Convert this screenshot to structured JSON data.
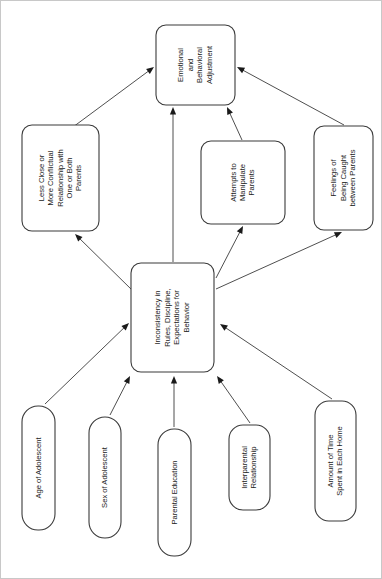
{
  "diagram": {
    "orientation": "rotated-90-counterclockwise",
    "colors": {
      "background": "#ffffff",
      "box_fill": "#ffffff",
      "box_stroke": "#3b3b3b",
      "text": "#1a1a1a",
      "edge": "#3b3b3b",
      "page_border": "#c8c8c8"
    },
    "nodes": [
      {
        "id": "emotional-behavioral-adjustment",
        "name": "Emotional and Behavioral Adjustment",
        "lines": [
          "Emotional",
          "and",
          "Behavioral",
          "Adjustment"
        ],
        "x": 155,
        "y": 24,
        "w": 79,
        "h": 80,
        "r": 10,
        "role": "outcome"
      },
      {
        "id": "less-close-more-conflictual",
        "name": "Less Close or More Conflictual Relationship with One or Both Parents",
        "lines": [
          "Less Close or",
          "More Conflictual",
          "Relationship with",
          "One or Both",
          "Parents"
        ],
        "x": 21,
        "y": 124,
        "w": 77,
        "h": 106,
        "r": 10,
        "role": "mediator"
      },
      {
        "id": "attempts-to-manipulate-parents",
        "name": "Attempts to Manipulate Parents",
        "lines": [
          "Attempts to",
          "Manipulate",
          "Parents"
        ],
        "x": 200,
        "y": 140,
        "w": 84,
        "h": 83,
        "r": 10,
        "role": "mediator"
      },
      {
        "id": "feelings-of-being-caught",
        "name": "Feelings of Being Caught between Parents",
        "lines": [
          "Feelings of",
          "Being Caught",
          "between Parents"
        ],
        "x": 313,
        "y": 125,
        "w": 59,
        "h": 104,
        "r": 10,
        "role": "mediator"
      },
      {
        "id": "inconsistency-in-rules",
        "name": "Inconsistency in Rules, Discipline, Expectations for Behavior",
        "lines": [
          "Inconsistency in",
          "Rules, Discipline,",
          "Expectations for",
          "Behavior"
        ],
        "x": 130,
        "y": 262,
        "w": 83,
        "h": 109,
        "r": 10,
        "role": "central"
      },
      {
        "id": "age-of-adolescent",
        "name": "Age of Adolescent",
        "lines": [
          "Age of Adolescent"
        ],
        "x": 21,
        "y": 405,
        "w": 33,
        "h": 124,
        "r": 16,
        "role": "predictor"
      },
      {
        "id": "sex-of-adolescent",
        "name": "Sex of Adolescent",
        "lines": [
          "Sex of Adolescent"
        ],
        "x": 88,
        "y": 416,
        "w": 32,
        "h": 121,
        "r": 16,
        "role": "predictor"
      },
      {
        "id": "parental-education",
        "name": "Parental Education",
        "lines": [
          "Parental Education"
        ],
        "x": 157,
        "y": 428,
        "w": 33,
        "h": 127,
        "r": 16,
        "role": "predictor"
      },
      {
        "id": "interparental-relationship",
        "name": "Interparental Relationship",
        "lines": [
          "Interparental",
          "Relationship"
        ],
        "x": 228,
        "y": 424,
        "w": 41,
        "h": 85,
        "r": 14,
        "role": "predictor"
      },
      {
        "id": "amount-of-time-spent-in-each-home",
        "name": "Amount of Time Spent in Each Home",
        "lines": [
          "Amount of Time",
          "Spent in Each Home"
        ],
        "x": 314,
        "y": 400,
        "w": 41,
        "h": 120,
        "r": 14,
        "role": "predictor"
      }
    ],
    "edges": [
      {
        "id": "edge-less-close-to-adjustment",
        "from": "less-close-more-conflictual",
        "to": "emotional-behavioral-adjustment",
        "x1": 72,
        "y1": 126,
        "x2": 153,
        "y2": 66
      },
      {
        "id": "edge-inconsistency-to-adjustment",
        "from": "inconsistency-in-rules",
        "to": "emotional-behavioral-adjustment",
        "x1": 172,
        "y1": 261,
        "x2": 172,
        "y2": 106
      },
      {
        "id": "edge-manipulate-to-adjustment",
        "from": "attempts-to-manipulate-parents",
        "to": "emotional-behavioral-adjustment",
        "x1": 241,
        "y1": 139,
        "x2": 226,
        "y2": 106
      },
      {
        "id": "edge-caught-to-adjustment",
        "from": "feelings-of-being-caught",
        "to": "emotional-behavioral-adjustment",
        "x1": 343,
        "y1": 124,
        "x2": 236,
        "y2": 66
      },
      {
        "id": "edge-inconsistency-to-less-close",
        "from": "inconsistency-in-rules",
        "to": "less-close-more-conflictual",
        "x1": 132,
        "y1": 290,
        "x2": 74,
        "y2": 233
      },
      {
        "id": "edge-inconsistency-to-manipulate",
        "from": "inconsistency-in-rules",
        "to": "attempts-to-manipulate-parents",
        "x1": 215,
        "y1": 277,
        "x2": 242,
        "y2": 225
      },
      {
        "id": "edge-inconsistency-to-caught",
        "from": "inconsistency-in-rules",
        "to": "feelings-of-being-caught",
        "x1": 215,
        "y1": 288,
        "x2": 341,
        "y2": 231
      },
      {
        "id": "edge-age-to-inconsistency",
        "from": "age-of-adolescent",
        "to": "inconsistency-in-rules",
        "x1": 44,
        "y1": 403,
        "x2": 128,
        "y2": 322
      },
      {
        "id": "edge-sex-to-inconsistency",
        "from": "sex-of-adolescent",
        "to": "inconsistency-in-rules",
        "x1": 109,
        "y1": 414,
        "x2": 129,
        "y2": 375
      },
      {
        "id": "edge-education-to-inconsistency",
        "from": "parental-education",
        "to": "inconsistency-in-rules",
        "x1": 173,
        "y1": 426,
        "x2": 173,
        "y2": 375
      },
      {
        "id": "edge-interparental-to-inconsistency",
        "from": "interparental-relationship",
        "to": "inconsistency-in-rules",
        "x1": 249,
        "y1": 422,
        "x2": 216,
        "y2": 375
      },
      {
        "id": "edge-time-to-inconsistency",
        "from": "amount-of-time-spent-in-each-home",
        "to": "inconsistency-in-rules",
        "x1": 331,
        "y1": 398,
        "x2": 219,
        "y2": 323
      }
    ]
  }
}
